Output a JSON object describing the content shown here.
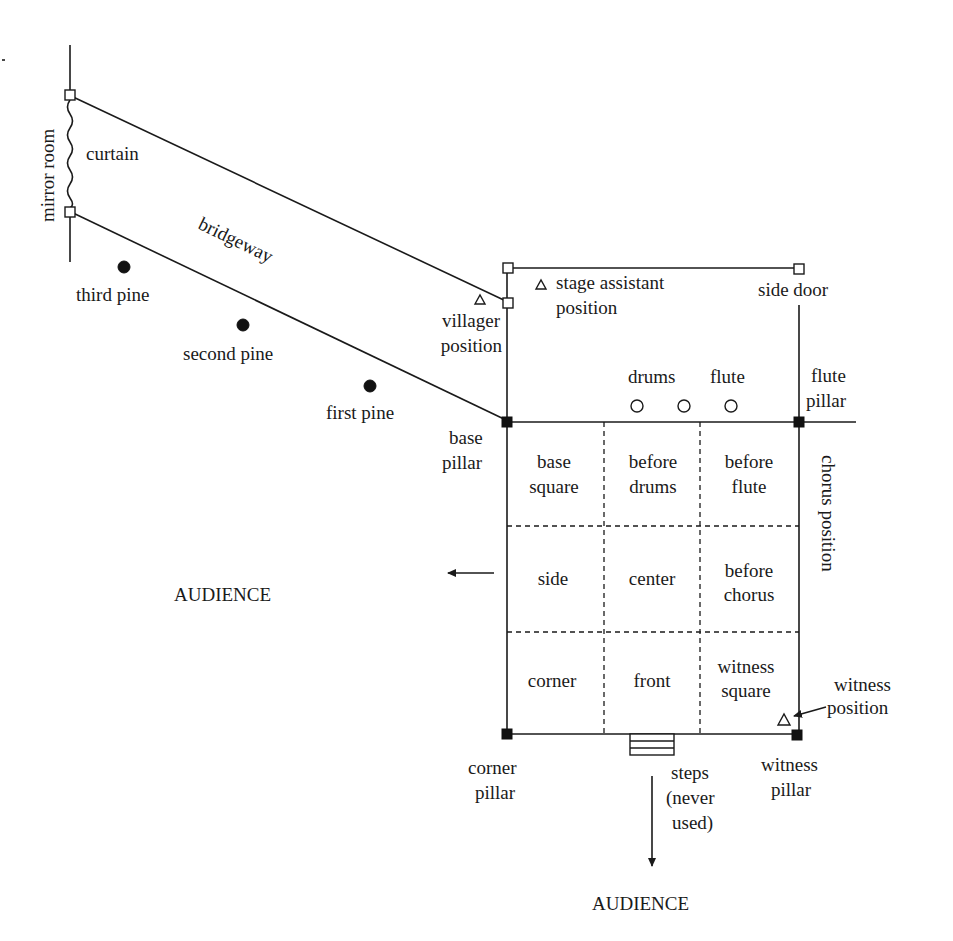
{
  "diagram": {
    "labels": {
      "mirror_room": "mirror room",
      "curtain": "curtain",
      "bridgeway": "bridgeway",
      "third_pine": "third pine",
      "second_pine": "second pine",
      "first_pine": "first pine",
      "villager_position_1": "villager",
      "villager_position_2": "position",
      "stage_assistant_1": "stage assistant",
      "stage_assistant_2": "position",
      "side_door": "side door",
      "drums": "drums",
      "flute": "flute",
      "flute_pillar_1": "flute",
      "flute_pillar_2": "pillar",
      "base_pillar_1": "base",
      "base_pillar_2": "pillar",
      "chorus_position": "chorus position",
      "witness_position_1": "witness",
      "witness_position_2": "position",
      "corner_pillar_1": "corner",
      "corner_pillar_2": "pillar",
      "witness_pillar_1": "witness",
      "witness_pillar_2": "pillar",
      "steps_1": "steps",
      "steps_2": "(never",
      "steps_3": "used)",
      "audience_left": "AUDIENCE",
      "audience_bottom": "AUDIENCE"
    },
    "grid": [
      [
        "base",
        "square"
      ],
      [
        "before",
        "drums"
      ],
      [
        "before",
        "flute"
      ],
      [
        "side",
        ""
      ],
      [
        "center",
        ""
      ],
      [
        "before",
        "chorus"
      ],
      [
        "corner",
        ""
      ],
      [
        "front",
        ""
      ],
      [
        "witness",
        "square"
      ]
    ],
    "colors": {
      "ink": "#1a1a1a",
      "background": "#ffffff"
    }
  }
}
